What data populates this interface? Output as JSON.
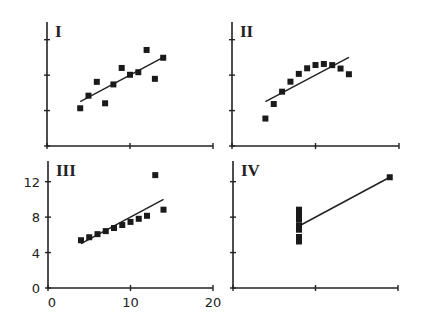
{
  "chart_data": [
    {
      "type": "scatter",
      "title": "I",
      "x": [
        10,
        8,
        13,
        9,
        11,
        14,
        6,
        4,
        12,
        7,
        5
      ],
      "y": [
        8.04,
        6.95,
        7.58,
        8.81,
        8.33,
        9.96,
        7.24,
        4.26,
        10.84,
        4.82,
        5.68
      ],
      "fit_line": {
        "x": [
          4,
          14
        ],
        "y": [
          5.0,
          10.0
        ]
      },
      "xlim": [
        0,
        20
      ],
      "ylim": [
        0,
        14
      ],
      "xticks": [
        0,
        10,
        20
      ],
      "yticks": [
        0,
        4,
        8,
        12
      ],
      "show_tick_labels": false,
      "grid": false
    },
    {
      "type": "scatter",
      "title": "II",
      "x": [
        10,
        8,
        13,
        9,
        11,
        14,
        6,
        4,
        12,
        7,
        5
      ],
      "y": [
        9.14,
        8.14,
        8.74,
        8.77,
        9.26,
        8.1,
        6.13,
        3.1,
        9.13,
        7.26,
        4.74
      ],
      "fit_line": {
        "x": [
          4,
          14
        ],
        "y": [
          5.0,
          10.0
        ]
      },
      "xlim": [
        0,
        20
      ],
      "ylim": [
        0,
        14
      ],
      "xticks": [
        0,
        10,
        20
      ],
      "yticks": [
        0,
        4,
        8,
        12
      ],
      "show_tick_labels": false,
      "grid": false
    },
    {
      "type": "scatter",
      "title": "III",
      "x": [
        10,
        8,
        13,
        9,
        11,
        14,
        6,
        4,
        12,
        7,
        5
      ],
      "y": [
        7.46,
        6.77,
        12.74,
        7.11,
        7.81,
        8.84,
        6.08,
        5.39,
        8.15,
        6.42,
        5.73
      ],
      "fit_line": {
        "x": [
          4,
          14
        ],
        "y": [
          5.0,
          10.0
        ]
      },
      "xlim": [
        0,
        20
      ],
      "ylim": [
        0,
        14
      ],
      "xticks": [
        0,
        10,
        20
      ],
      "yticks": [
        0,
        4,
        8,
        12
      ],
      "xtick_labels": [
        "0",
        "10",
        "20"
      ],
      "ytick_labels": [
        "0",
        "4",
        "8",
        "12"
      ],
      "show_tick_labels": true,
      "grid": false
    },
    {
      "type": "scatter",
      "title": "IV",
      "x": [
        8,
        8,
        8,
        8,
        8,
        8,
        8,
        19,
        8,
        8,
        8
      ],
      "y": [
        6.58,
        5.76,
        7.71,
        8.84,
        8.47,
        7.04,
        5.25,
        12.5,
        5.56,
        7.91,
        6.89
      ],
      "fit_line": {
        "x": [
          8,
          19
        ],
        "y": [
          7.0,
          12.5
        ]
      },
      "xlim": [
        0,
        20
      ],
      "ylim": [
        0,
        14
      ],
      "xticks": [
        0,
        10,
        20
      ],
      "yticks": [
        0,
        4,
        8,
        12
      ],
      "show_tick_labels": false,
      "grid": false
    }
  ],
  "panels": [
    {
      "label": "I"
    },
    {
      "label": "II"
    },
    {
      "label": "III"
    },
    {
      "label": "IV"
    }
  ],
  "axes": {
    "x_tick_labels": [
      "0",
      "10",
      "20"
    ],
    "y_tick_labels": [
      "0",
      "4",
      "8",
      "12"
    ]
  }
}
